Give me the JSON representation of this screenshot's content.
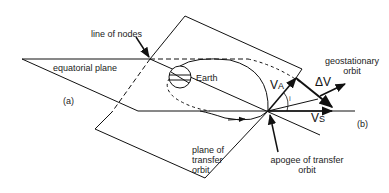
{
  "diagram": {
    "labels": {
      "line_of_nodes": "line of nodes",
      "equatorial_plane": "equatorial plane",
      "earth": "Earth",
      "geostationary_orbit_line1": "geostationary",
      "geostationary_orbit_line2": "orbit",
      "plane_of_transfer_line1": "plane of",
      "plane_of_transfer_line2": "transfer",
      "plane_of_transfer_line3": "orbit",
      "apogee_line1": "apogee of transfer",
      "apogee_line2": "orbit",
      "point_a": "(a)",
      "point_b": "(b)",
      "va_main": "V",
      "va_sub": "A",
      "vs_main": "V",
      "vs_sub": "S",
      "delta_v": "ΔV",
      "inclination": "i"
    },
    "colors": {
      "stroke": "#111111",
      "text": "#222222",
      "background": "#ffffff"
    }
  }
}
